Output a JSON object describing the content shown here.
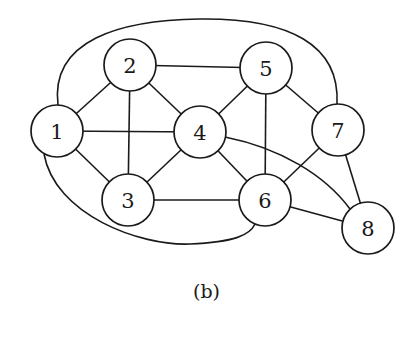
{
  "figure": {
    "caption": "(b)",
    "node_radius": 26,
    "stroke_color": "#1a1a1a",
    "nodes": [
      {
        "id": "1",
        "label": "1",
        "x": 57,
        "y": 131
      },
      {
        "id": "2",
        "label": "2",
        "x": 130,
        "y": 65
      },
      {
        "id": "3",
        "label": "3",
        "x": 128,
        "y": 200
      },
      {
        "id": "4",
        "label": "4",
        "x": 200,
        "y": 132
      },
      {
        "id": "5",
        "label": "5",
        "x": 266,
        "y": 68
      },
      {
        "id": "6",
        "label": "6",
        "x": 265,
        "y": 200
      },
      {
        "id": "7",
        "label": "7",
        "x": 338,
        "y": 130
      },
      {
        "id": "8",
        "label": "8",
        "x": 368,
        "y": 228
      }
    ],
    "edges": [
      {
        "from": "1",
        "to": "2",
        "type": "straight"
      },
      {
        "from": "1",
        "to": "3",
        "type": "straight"
      },
      {
        "from": "1",
        "to": "4",
        "type": "straight"
      },
      {
        "from": "2",
        "to": "3",
        "type": "straight"
      },
      {
        "from": "2",
        "to": "4",
        "type": "straight"
      },
      {
        "from": "2",
        "to": "5",
        "type": "straight"
      },
      {
        "from": "3",
        "to": "4",
        "type": "straight"
      },
      {
        "from": "3",
        "to": "6",
        "type": "straight"
      },
      {
        "from": "4",
        "to": "5",
        "type": "straight"
      },
      {
        "from": "4",
        "to": "6",
        "type": "straight"
      },
      {
        "from": "5",
        "to": "6",
        "type": "straight"
      },
      {
        "from": "5",
        "to": "7",
        "type": "straight"
      },
      {
        "from": "6",
        "to": "7",
        "type": "straight"
      },
      {
        "from": "6",
        "to": "8",
        "type": "straight"
      },
      {
        "from": "7",
        "to": "8",
        "type": "straight"
      },
      {
        "from": "1",
        "to": "7",
        "type": "curve",
        "path": "M 58 105 C 50 40, 120 20, 200 19 C 290 18, 340 45, 337 104"
      },
      {
        "from": "1",
        "to": "6",
        "type": "curve",
        "path": "M 44 154 C 55 215, 140 246, 190 244 C 235 242, 250 235, 255 224"
      },
      {
        "from": "4",
        "to": "8",
        "type": "curve",
        "path": "M 225 137 C 280 148, 325 175, 350 209"
      }
    ]
  }
}
